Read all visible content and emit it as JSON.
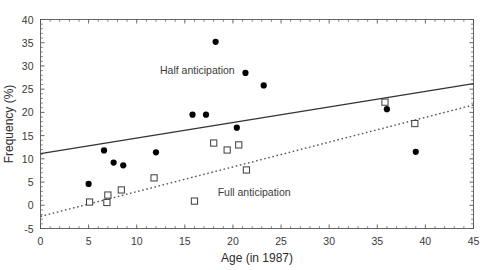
{
  "chart_data": {
    "type": "scatter",
    "title": "",
    "xlabel": "Age (in 1987)",
    "ylabel": "Frequency (%)",
    "xlim": [
      0,
      45
    ],
    "ylim": [
      -5,
      40
    ],
    "xticks": [
      0,
      5,
      10,
      15,
      20,
      25,
      30,
      35,
      40,
      45
    ],
    "yticks": [
      -5,
      0,
      5,
      10,
      15,
      20,
      25,
      30,
      35,
      40
    ],
    "xtick_labels": [
      "0",
      "5",
      "10",
      "15",
      "20",
      "25",
      "30",
      "35",
      "40",
      "45"
    ],
    "ytick_labels": [
      "-5",
      "0",
      "5",
      "10",
      "15",
      "20",
      "25",
      "30",
      "35",
      "40"
    ],
    "grid": false,
    "legend_position": "inline-annotation",
    "series": [
      {
        "name": "Half anticipation",
        "marker": "filled-circle",
        "color": "#000000",
        "annotation": "Half anticipation",
        "annotation_x": 16.3,
        "annotation_y": 29.2,
        "points": [
          {
            "x": 5.0,
            "y": 4.6
          },
          {
            "x": 6.6,
            "y": 11.8
          },
          {
            "x": 7.6,
            "y": 9.2
          },
          {
            "x": 8.6,
            "y": 8.6
          },
          {
            "x": 12.0,
            "y": 11.4
          },
          {
            "x": 15.8,
            "y": 19.5
          },
          {
            "x": 17.2,
            "y": 19.5
          },
          {
            "x": 18.2,
            "y": 35.2
          },
          {
            "x": 20.4,
            "y": 16.7
          },
          {
            "x": 21.3,
            "y": 28.5
          },
          {
            "x": 23.2,
            "y": 25.8
          },
          {
            "x": 36.0,
            "y": 20.7
          },
          {
            "x": 39.0,
            "y": 11.5
          }
        ]
      },
      {
        "name": "Full anticipation",
        "marker": "open-square",
        "color": "#444444",
        "annotation": "Full anticipation",
        "annotation_x": 22.2,
        "annotation_y": 2.8,
        "points": [
          {
            "x": 5.1,
            "y": 0.7
          },
          {
            "x": 6.9,
            "y": 0.6
          },
          {
            "x": 7.0,
            "y": 2.2
          },
          {
            "x": 8.4,
            "y": 3.3
          },
          {
            "x": 11.8,
            "y": 5.9
          },
          {
            "x": 16.0,
            "y": 0.9
          },
          {
            "x": 18.0,
            "y": 13.4
          },
          {
            "x": 19.4,
            "y": 11.9
          },
          {
            "x": 20.6,
            "y": 13.0
          },
          {
            "x": 21.4,
            "y": 7.6
          },
          {
            "x": 35.8,
            "y": 22.2
          },
          {
            "x": 38.9,
            "y": 17.6
          }
        ]
      }
    ],
    "trendlines": [
      {
        "name": "half-anticipation-trend",
        "style": "solid",
        "color": "#333333",
        "x_start": 0,
        "y_start": 11.1,
        "x_end": 45,
        "y_end": 26.2
      },
      {
        "name": "full-anticipation-trend",
        "style": "dotted",
        "color": "#555555",
        "x_start": 0,
        "y_start": -2.4,
        "x_end": 45,
        "y_end": 21.6
      }
    ]
  }
}
